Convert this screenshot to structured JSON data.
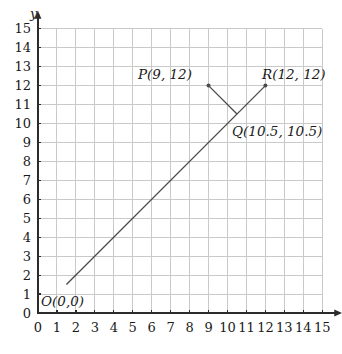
{
  "chart_data": {
    "type": "line",
    "title": "",
    "xlabel": "",
    "ylabel": "y",
    "xlim": [
      0,
      15
    ],
    "ylim": [
      0,
      15
    ],
    "grid": true,
    "legend": "none",
    "x_ticks": [
      "0",
      "1",
      "2",
      "3",
      "4",
      "5",
      "6",
      "7",
      "8",
      "9",
      "10",
      "11",
      "12",
      "13",
      "14",
      "15"
    ],
    "y_ticks": [
      "0",
      "1",
      "2",
      "3",
      "4",
      "5",
      "6",
      "7",
      "8",
      "9",
      "10",
      "11",
      "12",
      "13",
      "14",
      "15"
    ],
    "series": [
      {
        "name": "line-OR",
        "points": [
          [
            1.5,
            1.5
          ],
          [
            12,
            12
          ]
        ]
      },
      {
        "name": "segment-PQ",
        "points": [
          [
            9,
            12
          ],
          [
            10.5,
            10.5
          ]
        ]
      }
    ],
    "annotations": [
      {
        "name": "O",
        "label": "O(0,0)",
        "x": 0,
        "y": 0
      },
      {
        "name": "P",
        "label": "P(9, 12)",
        "x": 9,
        "y": 12
      },
      {
        "name": "Q",
        "label": "Q(10.5, 10.5)",
        "x": 10.5,
        "y": 10.5
      },
      {
        "name": "R",
        "label": "R(12, 12)",
        "x": 12,
        "y": 12
      }
    ],
    "marked_points": [
      {
        "name": "P",
        "x": 9,
        "y": 12
      },
      {
        "name": "R",
        "x": 12,
        "y": 12
      }
    ],
    "colors": {
      "grid": "#c9c9c9",
      "axis": "#2b2b2b",
      "line": "#4a4a4a",
      "text": "#1a1a1a",
      "background": "#ffffff"
    }
  },
  "labels": {
    "y_axis_name": "y",
    "origin": "O(0,0)",
    "p": "P(9, 12)",
    "q": "Q(10.5, 10.5)",
    "r": "R(12, 12)"
  },
  "axis_numbers": {
    "x": [
      "0",
      "1",
      "2",
      "3",
      "4",
      "5",
      "6",
      "7",
      "8",
      "9",
      "10",
      "11",
      "12",
      "13",
      "14",
      "15"
    ],
    "y": [
      "0",
      "1",
      "2",
      "3",
      "4",
      "5",
      "6",
      "7",
      "8",
      "9",
      "10",
      "11",
      "12",
      "13",
      "14",
      "15"
    ]
  }
}
